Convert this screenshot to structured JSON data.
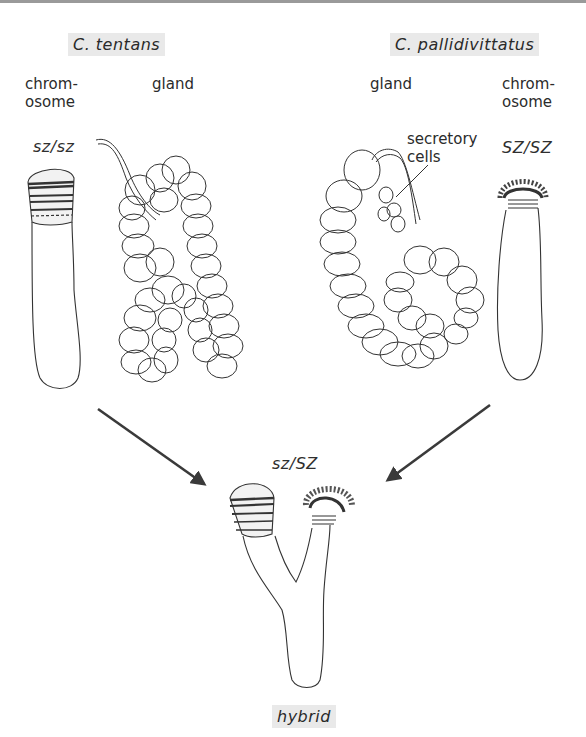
{
  "figure": {
    "left_species": {
      "name": "C. tentans",
      "chromosome_label": "chrom-\nosome",
      "gland_label": "gland",
      "genotype": "sz/sz"
    },
    "right_species": {
      "name": "C. pallidivittatus",
      "chromosome_label": "chrom-\nosome",
      "gland_label": "gland",
      "genotype": "SZ/SZ",
      "annotation": "secretory\ncells"
    },
    "hybrid": {
      "genotype": "sz/SZ",
      "label": "hybrid"
    },
    "colors": {
      "label_background": "#e9e9e9",
      "line": "#333333",
      "arrow": "#3a3a3a"
    }
  }
}
